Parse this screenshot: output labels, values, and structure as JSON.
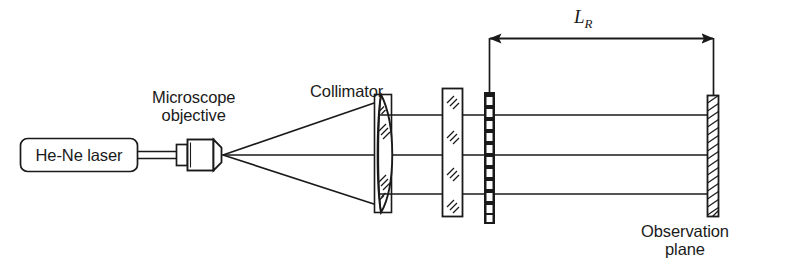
{
  "figure": {
    "kind": "optical-setup-diagram",
    "background_color": "#ffffff",
    "stroke_color": "#1a1a1a",
    "labels": {
      "laser_source": "He-Ne laser",
      "microscope_objective_line1": "Microscope",
      "microscope_objective_line2": "objective",
      "collimator": "Collimator",
      "distance_symbol": "L",
      "distance_subscript": "R",
      "observation_line1": "Observation",
      "observation_line2": "plane"
    },
    "components": [
      {
        "name": "he-ne-laser",
        "label": "He-Ne laser",
        "shape": "rounded-rectangle"
      },
      {
        "name": "microscope-objective",
        "label": "Microscope objective",
        "shape": "barrel-with-cone"
      },
      {
        "name": "collimator-lens",
        "label": "Collimator",
        "shape": "mounted-lens-hatched"
      },
      {
        "name": "glass-plate",
        "label": "",
        "shape": "hatched-plate",
        "hatch_segments": 4
      },
      {
        "name": "grating-mask",
        "label": "",
        "shape": "alternating-square-bar",
        "aperture_count": 11
      },
      {
        "name": "observation-plane",
        "label": "Observation plane",
        "shape": "hatched-screen"
      }
    ],
    "beams": {
      "collimated_ray_count": 3,
      "diverging_from": "objective-focal-point",
      "description": "diverging cone from objective focus, collimated parallel beam after lens"
    },
    "dimension": {
      "name": "L_R",
      "style": "double-headed-arrow",
      "from_component": "grating-mask",
      "to_component": "observation-plane"
    }
  }
}
